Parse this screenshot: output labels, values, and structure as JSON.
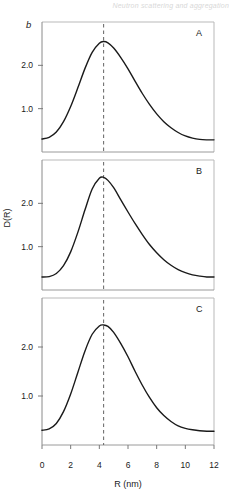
{
  "header": {
    "running_title": "Neutron scattering and aggregation"
  },
  "figure": {
    "part_label": "b",
    "panels": [
      {
        "label": "A"
      },
      {
        "label": "B"
      },
      {
        "label": "C"
      }
    ]
  },
  "chart_data": {
    "type": "line",
    "title": "",
    "xlabel": "R (nm)",
    "ylabel": "D(R)",
    "xlim": [
      0,
      12
    ],
    "ylim": [
      0,
      3.0
    ],
    "xticks": [
      0,
      2,
      4,
      6,
      8,
      10,
      12
    ],
    "xticklabels": [
      "0",
      "2",
      "4",
      "6",
      "8",
      "10",
      "12"
    ],
    "yticks": [
      1.0,
      2.0
    ],
    "yticklabels": [
      "1.0",
      "2.0"
    ],
    "grid": false,
    "legend": false,
    "annotation_line": {
      "type": "vertical-dashed",
      "x": 4.3,
      "label": ""
    },
    "panels": [
      {
        "name": "A",
        "peak_x": 4.3,
        "peak_y": 2.55,
        "x": [
          0.0,
          0.5,
          1.0,
          1.5,
          2.0,
          2.5,
          3.0,
          3.5,
          4.0,
          4.3,
          4.6,
          5.0,
          5.5,
          6.0,
          6.5,
          7.0,
          7.5,
          8.0,
          8.5,
          9.0,
          9.5,
          10.0,
          10.5,
          11.0,
          11.5,
          12.0
        ],
        "y": [
          0.3,
          0.34,
          0.46,
          0.7,
          1.05,
          1.48,
          1.93,
          2.3,
          2.51,
          2.55,
          2.52,
          2.4,
          2.18,
          1.92,
          1.63,
          1.35,
          1.1,
          0.88,
          0.7,
          0.56,
          0.45,
          0.37,
          0.32,
          0.29,
          0.28,
          0.28
        ]
      },
      {
        "name": "B",
        "peak_x": 4.3,
        "peak_y": 2.6,
        "x": [
          0.0,
          0.5,
          1.0,
          1.5,
          2.0,
          2.5,
          3.0,
          3.5,
          4.0,
          4.3,
          4.6,
          5.0,
          5.5,
          6.0,
          6.5,
          7.0,
          7.5,
          8.0,
          8.5,
          9.0,
          9.5,
          10.0,
          10.5,
          11.0,
          11.5,
          12.0
        ],
        "y": [
          0.3,
          0.31,
          0.38,
          0.56,
          0.88,
          1.33,
          1.85,
          2.33,
          2.58,
          2.6,
          2.53,
          2.36,
          2.08,
          1.8,
          1.53,
          1.28,
          1.05,
          0.86,
          0.7,
          0.57,
          0.47,
          0.4,
          0.35,
          0.32,
          0.3,
          0.3
        ]
      },
      {
        "name": "C",
        "peak_x": 4.3,
        "peak_y": 2.45,
        "x": [
          0.0,
          0.5,
          1.0,
          1.5,
          2.0,
          2.5,
          3.0,
          3.5,
          4.0,
          4.3,
          4.6,
          5.0,
          5.5,
          6.0,
          6.5,
          7.0,
          7.5,
          8.0,
          8.5,
          9.0,
          9.5,
          10.0,
          10.5,
          11.0,
          11.5,
          12.0
        ],
        "y": [
          0.3,
          0.33,
          0.44,
          0.68,
          1.04,
          1.48,
          1.92,
          2.26,
          2.43,
          2.45,
          2.42,
          2.3,
          2.07,
          1.8,
          1.5,
          1.22,
          0.97,
          0.76,
          0.6,
          0.48,
          0.39,
          0.34,
          0.31,
          0.29,
          0.28,
          0.28
        ]
      }
    ]
  }
}
